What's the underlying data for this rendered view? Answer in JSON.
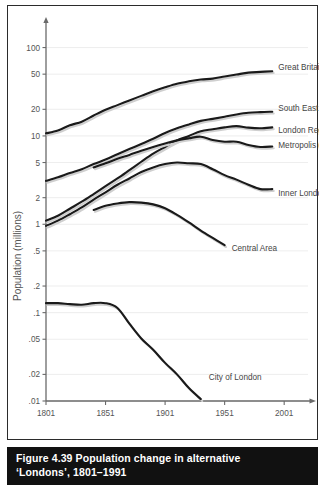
{
  "figure": {
    "number": "Figure 4.39",
    "caption_line1": "Population change in alternative",
    "caption_line2": "‘Londons’, 1801–1991",
    "caption_full": "Figure 4.39  Population change in alternative ‘Londons’, 1801–1991"
  },
  "chart_data": {
    "type": "line",
    "title": "Population change in alternative ‘Londons’, 1801–1991",
    "xlabel": "",
    "ylabel": "Population (millions)",
    "yscale": "log",
    "ylim": [
      0.01,
      150
    ],
    "xlim": [
      1801,
      2021
    ],
    "grid": true,
    "legend_position": "right-inline-labels",
    "xticks": [
      1801,
      1851,
      1901,
      1951,
      2001
    ],
    "xtick_labels": [
      "1801",
      "1851",
      "1901",
      "1951",
      "2001"
    ],
    "yticks": [
      0.01,
      0.02,
      0.05,
      0.1,
      0.2,
      0.5,
      1,
      2,
      5,
      10,
      20,
      50,
      100
    ],
    "ytick_labels": [
      ".01",
      ".02",
      ".05",
      ".1",
      ".2",
      ".5",
      "1",
      "2",
      "5",
      "10",
      "20",
      "50",
      "100"
    ],
    "series": [
      {
        "name": "Great Britain",
        "label": "Great Britain",
        "x": [
          1801,
          1811,
          1821,
          1831,
          1841,
          1851,
          1861,
          1871,
          1881,
          1891,
          1901,
          1911,
          1921,
          1931,
          1941,
          1951,
          1961,
          1971,
          1981,
          1991
        ],
        "values": [
          10.7,
          11.5,
          13.2,
          14.5,
          17.0,
          19.8,
          22.3,
          25.2,
          28.4,
          32.0,
          35.5,
          39.0,
          41.5,
          43.5,
          44.5,
          47.0,
          49.5,
          52.0,
          53.0,
          54.0
        ]
      },
      {
        "name": "South East Region",
        "label": "South East Region",
        "x": [
          1801,
          1811,
          1821,
          1831,
          1841,
          1851,
          1861,
          1871,
          1881,
          1891,
          1901,
          1911,
          1921,
          1931,
          1941,
          1951,
          1961,
          1971,
          1981,
          1991
        ],
        "values": [
          3.1,
          3.4,
          3.8,
          4.2,
          4.8,
          5.4,
          6.2,
          7.1,
          8.1,
          9.3,
          10.8,
          12.2,
          13.5,
          14.8,
          15.6,
          16.5,
          17.5,
          18.3,
          18.6,
          18.8
        ]
      },
      {
        "name": "London Region",
        "label": "London Region",
        "x": [
          1801,
          1811,
          1821,
          1831,
          1841,
          1851,
          1861,
          1871,
          1881,
          1891,
          1901,
          1911,
          1921,
          1931,
          1941,
          1951,
          1961,
          1971,
          1981,
          1991
        ],
        "values": [
          1.1,
          1.25,
          1.5,
          1.8,
          2.2,
          2.7,
          3.3,
          4.1,
          5.1,
          6.3,
          7.5,
          8.9,
          10.0,
          11.3,
          11.9,
          12.5,
          12.9,
          12.4,
          12.2,
          12.5
        ]
      },
      {
        "name": "Metropolis (GLC)",
        "label": "Metropolis (GLC)",
        "x": [
          1841,
          1851,
          1861,
          1871,
          1881,
          1891,
          1901,
          1911,
          1921,
          1931,
          1941,
          1951,
          1961,
          1971,
          1981,
          1991
        ],
        "values": [
          4.4,
          4.9,
          5.5,
          6.1,
          6.8,
          7.5,
          8.2,
          8.9,
          9.4,
          9.8,
          9.0,
          8.6,
          8.6,
          7.9,
          7.5,
          7.6
        ]
      },
      {
        "name": "Inner London (LCC)",
        "label": "Inner London (LCC)",
        "x": [
          1801,
          1811,
          1821,
          1831,
          1841,
          1851,
          1861,
          1871,
          1881,
          1891,
          1901,
          1911,
          1921,
          1931,
          1941,
          1951,
          1961,
          1971,
          1981,
          1991
        ],
        "values": [
          0.96,
          1.1,
          1.3,
          1.55,
          1.9,
          2.3,
          2.8,
          3.3,
          3.9,
          4.4,
          4.8,
          5.0,
          4.9,
          4.8,
          4.2,
          3.6,
          3.2,
          2.8,
          2.5,
          2.5
        ]
      },
      {
        "name": "Central Area",
        "label": "Central Area",
        "x": [
          1841,
          1851,
          1861,
          1871,
          1881,
          1891,
          1901,
          1911,
          1921,
          1931,
          1941,
          1951
        ],
        "values": [
          1.45,
          1.62,
          1.72,
          1.78,
          1.76,
          1.68,
          1.52,
          1.28,
          1.05,
          0.85,
          0.7,
          0.58
        ]
      },
      {
        "name": "City of London",
        "label": "City of London",
        "x": [
          1801,
          1811,
          1821,
          1831,
          1841,
          1851,
          1861,
          1871,
          1881,
          1891,
          1901,
          1911,
          1921,
          1931
        ],
        "values": [
          0.128,
          0.128,
          0.125,
          0.123,
          0.128,
          0.128,
          0.113,
          0.075,
          0.051,
          0.038,
          0.027,
          0.02,
          0.014,
          0.0105
        ]
      }
    ]
  },
  "labels": {
    "great_britain": "Great Britain",
    "south_east_region": "South East Region",
    "london_region": "London Region",
    "metropolis_glc": "Metropolis (GLC)",
    "inner_london_lcc": "Inner London (LCC)",
    "central_area": "Central Area",
    "city_of_london": "City of London"
  },
  "colors": {
    "line": "#1a1a1a",
    "grid": "#e9e9e9",
    "axis": "#6a6a6a",
    "caption_bg": "#111111",
    "caption_fg": "#ffffff",
    "frame": "#2b2b2b"
  }
}
